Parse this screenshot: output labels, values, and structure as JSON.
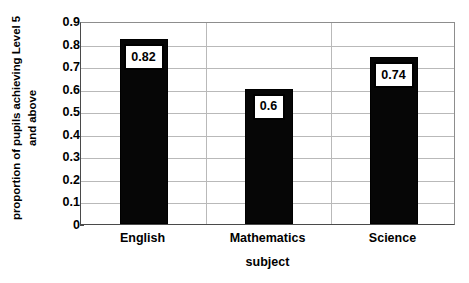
{
  "chart_data": {
    "type": "bar",
    "title": "",
    "subtitle": "",
    "categories": [
      "English",
      "Mathematics",
      "Science"
    ],
    "values": [
      0.82,
      0.6,
      0.74
    ],
    "data_labels": [
      "0.82",
      "0.6",
      "0.74"
    ],
    "xlabel": "subject",
    "ylabel": "proportion of pupils achieving Level 5\nand above",
    "ylabel_lines": [
      "proportion of pupils achieving Level 5",
      "and above"
    ],
    "ylim": [
      0,
      0.9
    ],
    "ytick_labels": [
      "0",
      "0.1",
      "0.2",
      "0.3",
      "0.4",
      "0.5",
      "0.6",
      "0.7",
      "0.8",
      "0.9"
    ],
    "ytick_values": [
      0,
      0.1,
      0.2,
      0.3,
      0.4,
      0.5,
      0.6,
      0.7,
      0.8,
      0.9
    ],
    "grid": "horizontal-and-category-separators",
    "legend": "none",
    "legend_position": "none",
    "series": [
      {
        "name": "proportion achieving Level 5 and above",
        "values": [
          0.82,
          0.6,
          0.74
        ],
        "color": "#060606"
      }
    ],
    "colors": {
      "bar": "#060606",
      "gridline": "#b9b9b9",
      "axis": "#4a4a4a",
      "plot_background": "#ffffff",
      "label_box_fill": "#ffffff",
      "label_box_border": "#000000",
      "text": "#000000"
    }
  }
}
